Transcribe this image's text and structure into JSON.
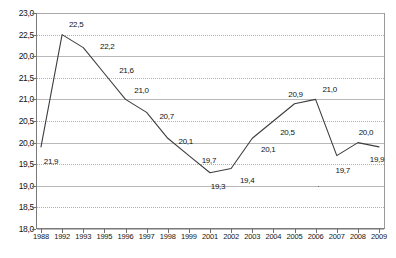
{
  "chart_data": {
    "type": "line",
    "title": "",
    "subtitle": "",
    "xlabel": "",
    "ylabel": "",
    "ylim": [
      18.0,
      23.0
    ],
    "grid": true,
    "legend": "none",
    "legend_entries": [],
    "annotations": [],
    "line_color": "#3d3d3d",
    "categories": [
      "1988",
      "1992",
      "1993",
      "1995",
      "1996",
      "1997",
      "1998",
      "1999",
      "2001",
      "2002",
      "2003",
      "2004",
      "2005",
      "2006",
      "2007",
      "2008",
      "2009"
    ],
    "x": [
      "1988",
      "1992",
      "1993",
      "1995",
      "1996",
      "1997",
      "1998",
      "1999",
      "2001",
      "2002",
      "2003",
      "2004",
      "2005",
      "2006",
      "2007",
      "2008",
      "2009"
    ],
    "values": [
      19.9,
      22.5,
      22.2,
      21.6,
      21.0,
      20.7,
      20.1,
      19.7,
      19.3,
      19.4,
      20.1,
      20.5,
      20.9,
      21.0,
      19.7,
      20.0,
      19.9
    ],
    "point_labels": [
      "21,9",
      "22,5",
      "22,2",
      "21,6",
      "21,0",
      "20,7",
      "20,1",
      "19,7",
      "19,3",
      "19,4",
      "20,1",
      "20,5",
      "20,9",
      "21,0",
      "19,7",
      "20,0",
      "19,9"
    ],
    "ytick_labels": [
      "23,0",
      "22,5",
      "20,0",
      "21,5",
      "21,0",
      "20,5",
      "20,0",
      "19,5",
      "19,0",
      "18,5",
      "18,0"
    ],
    "ytick_values": [
      23.0,
      22.5,
      22.0,
      21.5,
      21.0,
      20.5,
      20.0,
      19.5,
      19.0,
      18.5,
      18.0
    ]
  },
  "axis": {
    "y_tick_labels": [
      "23,0",
      "22,5",
      "20,0",
      "21,5",
      "21,0",
      "20,5",
      "20,0",
      "19,5",
      "19,0",
      "18,5",
      "18,0"
    ],
    "x_tick_labels": [
      "1988",
      "1992",
      "1993",
      "1995",
      "1996",
      "1997",
      "1998",
      "1999",
      "2001",
      "2002",
      "2003",
      "2004",
      "2005",
      "2006",
      "2007",
      "2008",
      "2009"
    ]
  },
  "series_labels": [
    "21,9",
    "22,5",
    "22,2",
    "21,6",
    "21,0",
    "20,7",
    "20,1",
    "19,7",
    "19,3",
    "19,4",
    "20,1",
    "20,5",
    "20,9",
    "21,0",
    "19,7",
    "20,0",
    "19,9"
  ]
}
